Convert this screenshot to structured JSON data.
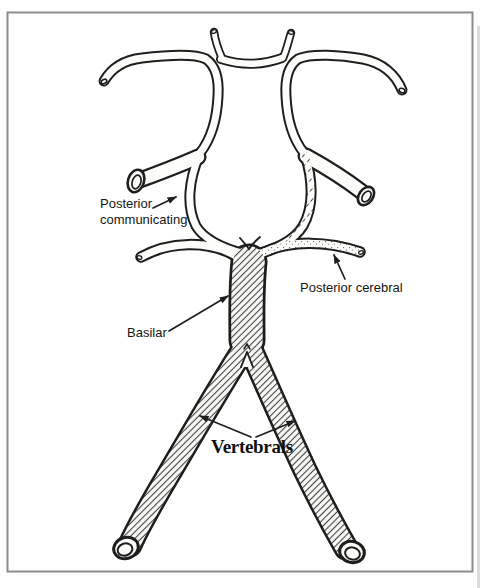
{
  "diagram": {
    "labels": {
      "posterior_communicating_line1": "Posterior",
      "posterior_communicating_line2": "communicating",
      "posterior_cerebral": "Posterior cerebral",
      "basilar": "Basilar",
      "vertebrals": "Vertebrals"
    },
    "colors": {
      "ink": "#1e1e1c",
      "paper": "#fcfcfa",
      "frame_border": "#8c8c8c",
      "page_edge": "#d6d6d6"
    }
  }
}
